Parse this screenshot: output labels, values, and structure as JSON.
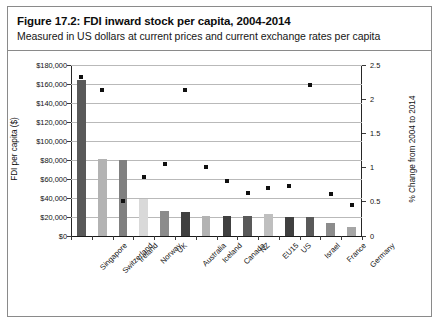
{
  "figure": {
    "title": "Figure 17.2: FDI inward stock per capita, 2004-2014",
    "subtitle": "Measured in US dollars at current prices and current exchange rates per capita"
  },
  "chart_data": {
    "type": "bar",
    "title": "FDI inward stock per capita, 2004-2014",
    "xlabel": "",
    "ylabel": "FDI per capita ($)",
    "y2label": "% Change from 2004 to 2014",
    "ylim": [
      0,
      180000
    ],
    "y2lim": [
      0,
      2.5
    ],
    "ystep": 20000,
    "y2step": 0.5,
    "grid": true,
    "legend": "none",
    "categories": [
      "Singapore",
      "Switzerland",
      "Ireland",
      "Norway",
      "UK",
      "Australia",
      "Iceland",
      "Canada",
      "NZ",
      "EU15",
      "US",
      "Israel",
      "France",
      "Germany"
    ],
    "ytick_labels": [
      "$0",
      "$20,000",
      "$40,000",
      "$60,000",
      "$80,000",
      "$100,000",
      "$120,000",
      "$140,000",
      "$160,000",
      "$180,000"
    ],
    "y2tick_labels": [
      "0",
      "0.5",
      "1",
      "1.5",
      "2",
      "2.5"
    ],
    "series": [
      {
        "name": "FDI inward stock per capita ($)",
        "axis": "left",
        "type": "bar",
        "values": [
          164000,
          81000,
          79000,
          38000,
          26000,
          25000,
          21000,
          21000,
          21000,
          23000,
          19000,
          19500,
          13000,
          9000
        ],
        "colors": [
          "#595959",
          "#b3b3b3",
          "#808080",
          "#d9d9d9",
          "#8c8c8c",
          "#404040",
          "#b3b3b3",
          "#404040",
          "#595959",
          "#bfbfbf",
          "#404040",
          "#595959",
          "#8c8c8c",
          "#a6a6a6"
        ]
      },
      {
        "name": "% Change from 2004 to 2014",
        "axis": "right",
        "type": "scatter",
        "values": [
          2.32,
          2.12,
          0.5,
          0.85,
          1.05,
          2.12,
          1.0,
          0.8,
          0.62,
          0.7,
          0.73,
          2.2,
          0.6,
          0.45
        ]
      }
    ]
  }
}
